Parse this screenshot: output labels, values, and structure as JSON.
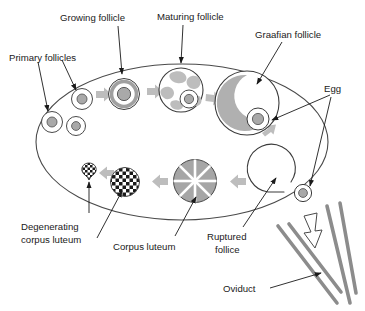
{
  "figure": {
    "background_color": "#ffffff"
  },
  "colors": {
    "outline": "#3b3b3b",
    "leader_line": "#1a1a1a",
    "text": "#1a1a1a",
    "structure_gray": "#a9a9a9",
    "structure_gray_dark": "#8f8f8f",
    "flow_arrow_gray": "#bdbdbd",
    "oviduct_gray": "#8c8c8c",
    "checker_dark": "#1a1a1a",
    "checker_light": "#ffffff"
  },
  "labels": {
    "primary_follicles": "Primary follicles",
    "growing_follicle": "Growing follicle",
    "maturing_follicle": "Maturing follicle",
    "graafian_follicle": "Graafian follicle",
    "egg": "Egg",
    "ruptured_follicle_line1": "Ruptured",
    "ruptured_follicle_line2": "follice",
    "corpus_luteum": "Corpus luteum",
    "degenerating_line1": "Degenerating",
    "degenerating_line2": "corpus luteum",
    "oviduct": "Oviduct"
  },
  "structures": [
    {
      "name": "primary-follicle-a",
      "label_ref": "primary_follicles",
      "cx": 52,
      "cy": 122,
      "r": 11
    },
    {
      "name": "primary-follicle-b",
      "label_ref": "primary_follicles",
      "cx": 76,
      "cy": 126,
      "r": 10
    },
    {
      "name": "primary-follicle-c",
      "label_ref": "primary_follicles",
      "cx": 82,
      "cy": 99,
      "r": 11
    },
    {
      "name": "growing-follicle",
      "label_ref": "growing_follicle",
      "cx": 124,
      "cy": 94,
      "r": 16
    },
    {
      "name": "maturing-follicle",
      "label_ref": "maturing_follicle",
      "cx": 181,
      "cy": 90,
      "r": 23
    },
    {
      "name": "graafian-follicle",
      "label_ref": "graafian_follicle",
      "cx": 247,
      "cy": 103,
      "r": 33
    },
    {
      "name": "ruptured-follicle",
      "label_ref": "ruptured_follicle_line1",
      "cx": 278,
      "cy": 170,
      "r": 25
    },
    {
      "name": "released-egg",
      "label_ref": "egg",
      "cx": 303,
      "cy": 193,
      "r": 9
    },
    {
      "name": "corpus-luteum",
      "label_ref": "corpus_luteum",
      "cx": 195,
      "cy": 181,
      "r": 22
    },
    {
      "name": "degenerating-corpus-luteum-large",
      "label_ref": "degenerating_line1",
      "cx": 125,
      "cy": 182,
      "r": 15
    },
    {
      "name": "degenerating-corpus-luteum-small",
      "label_ref": "degenerating_line1",
      "cx": 89,
      "cy": 172,
      "r": 8
    }
  ],
  "flow_arrows": [
    {
      "name": "flow-primary-to-growing",
      "x": 98,
      "y": 96,
      "rotation": 0
    },
    {
      "name": "flow-growing-to-maturing",
      "x": 150,
      "y": 93,
      "rotation": 0
    },
    {
      "name": "flow-maturing-to-graafian",
      "x": 208,
      "y": 99,
      "rotation": 8
    },
    {
      "name": "flow-graafian-to-ruptured",
      "x": 268,
      "y": 140,
      "rotation": 62
    },
    {
      "name": "flow-ruptured-to-corpus-luteum",
      "x": 235,
      "y": 183,
      "rotation": 180
    },
    {
      "name": "flow-corpus-to-degenerating",
      "x": 157,
      "y": 183,
      "rotation": 180
    },
    {
      "name": "flow-degenerating-out",
      "x": 106,
      "y": 174,
      "rotation": 180
    }
  ],
  "oviduct": {
    "name": "oviduct-structure",
    "line_count": 4,
    "release_arrow": "white-hollow-down-arrow"
  }
}
